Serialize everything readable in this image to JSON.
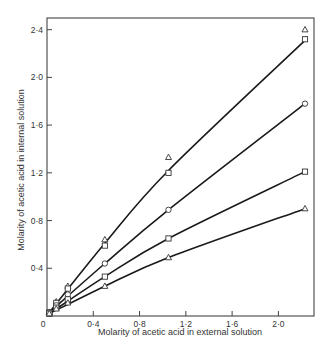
{
  "chart_data": {
    "type": "line",
    "title": "",
    "xlabel": "Molarity of acetic acid in external solution",
    "ylabel": "Molarity of acetic acid in internal solution",
    "xlim": [
      0,
      2.3
    ],
    "ylim": [
      0,
      2.5
    ],
    "x_ticks": [
      0,
      0.4,
      0.8,
      1.2,
      1.6,
      2.0
    ],
    "x_tick_labels": [
      "0",
      "0·4",
      "0·8",
      "1·2",
      "1·6",
      "2·0"
    ],
    "y_ticks": [
      0.4,
      0.8,
      1.2,
      1.6,
      2.0,
      2.4
    ],
    "y_tick_labels": [
      "0·4",
      "0·8",
      "1·2",
      "1·6",
      "2·0",
      "2·4"
    ],
    "grid": false,
    "legend": null,
    "series": [
      {
        "name": "series-1 (triangles, top)",
        "marker": "triangle",
        "x": [
          0.02,
          0.08,
          0.18,
          0.5,
          1.05,
          2.23
        ],
        "y": [
          0.03,
          0.12,
          0.25,
          0.64,
          1.33,
          2.4
        ]
      },
      {
        "name": "series-2 (squares, top)",
        "marker": "square",
        "x": [
          0.02,
          0.08,
          0.18,
          0.5,
          1.05,
          2.23
        ],
        "y": [
          0.03,
          0.11,
          0.23,
          0.59,
          1.2,
          2.32
        ]
      },
      {
        "name": "series-3 (circles)",
        "marker": "circle",
        "x": [
          0.02,
          0.08,
          0.18,
          0.5,
          1.05,
          2.23
        ],
        "y": [
          0.03,
          0.09,
          0.18,
          0.44,
          0.89,
          1.78
        ]
      },
      {
        "name": "series-4 (squares, lower)",
        "marker": "square",
        "x": [
          0.02,
          0.08,
          0.18,
          0.5,
          1.05,
          2.23
        ],
        "y": [
          0.02,
          0.07,
          0.14,
          0.33,
          0.65,
          1.21
        ]
      },
      {
        "name": "series-5 (triangles, lower)",
        "marker": "triangle",
        "x": [
          0.02,
          0.08,
          0.18,
          0.5,
          1.05,
          2.23
        ],
        "y": [
          0.02,
          0.06,
          0.11,
          0.25,
          0.49,
          0.9
        ]
      }
    ],
    "curves": [
      {
        "series": 0,
        "points": [
          [
            0.02,
            0.03
          ],
          [
            0.5,
            0.61
          ],
          [
            1.05,
            1.22
          ],
          [
            2.23,
            2.31
          ]
        ]
      },
      {
        "series": 2,
        "points": [
          [
            0.02,
            0.03
          ],
          [
            0.5,
            0.44
          ],
          [
            1.05,
            0.89
          ],
          [
            2.23,
            1.78
          ]
        ]
      },
      {
        "series": 3,
        "points": [
          [
            0.02,
            0.02
          ],
          [
            0.5,
            0.33
          ],
          [
            1.05,
            0.65
          ],
          [
            2.23,
            1.21
          ]
        ]
      },
      {
        "series": 4,
        "points": [
          [
            0.02,
            0.02
          ],
          [
            0.5,
            0.25
          ],
          [
            1.05,
            0.49
          ],
          [
            2.23,
            0.9
          ]
        ]
      }
    ]
  },
  "frame": {
    "left": 47,
    "top": 18,
    "right": 314,
    "bottom": 316,
    "x0_px": 47,
    "x_px_per_unit": 115.7,
    "y0_px": 316,
    "y_px_per_unit": 119.3
  }
}
